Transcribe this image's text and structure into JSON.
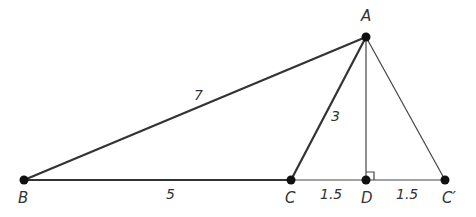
{
  "diagram": {
    "points": [
      {
        "id": "A",
        "label": "A"
      },
      {
        "id": "B",
        "label": "B"
      },
      {
        "id": "C",
        "label": "C"
      },
      {
        "id": "D",
        "label": "D"
      },
      {
        "id": "Cp",
        "label": "C′"
      }
    ],
    "segments": [
      {
        "from": "B",
        "to": "A",
        "length_label": "7"
      },
      {
        "from": "B",
        "to": "C",
        "length_label": "5"
      },
      {
        "from": "C",
        "to": "A",
        "length_label": "3"
      },
      {
        "from": "C",
        "to": "D",
        "length_label": "1.5"
      },
      {
        "from": "D",
        "to": "Cp",
        "length_label": "1.5"
      },
      {
        "from": "A",
        "to": "D",
        "length_label": ""
      },
      {
        "from": "A",
        "to": "Cp",
        "length_label": ""
      }
    ],
    "right_angle_at": "D",
    "colors": {
      "line": "#333333",
      "point": "#111111"
    }
  }
}
